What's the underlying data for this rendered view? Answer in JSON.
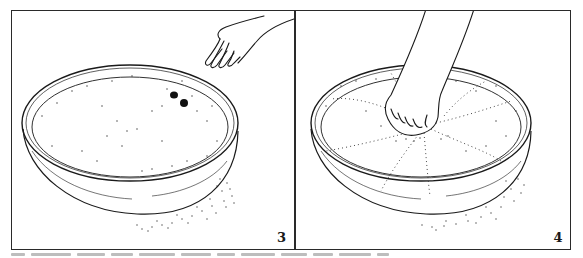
{
  "figure": {
    "panels": [
      {
        "id": "panel-3",
        "number": "3",
        "scene": "flat bowl of scattered grains; hand with fingers pointing down at two dark spots"
      },
      {
        "id": "panel-4",
        "number": "4",
        "scene": "flat bowl of scattered grains; hand pressing fingertips into center, grains radiating outward"
      }
    ],
    "caption": "",
    "colors": {
      "ink": "#1a1a1a",
      "border": "#2a2a2a",
      "paper": "#ffffff"
    }
  }
}
